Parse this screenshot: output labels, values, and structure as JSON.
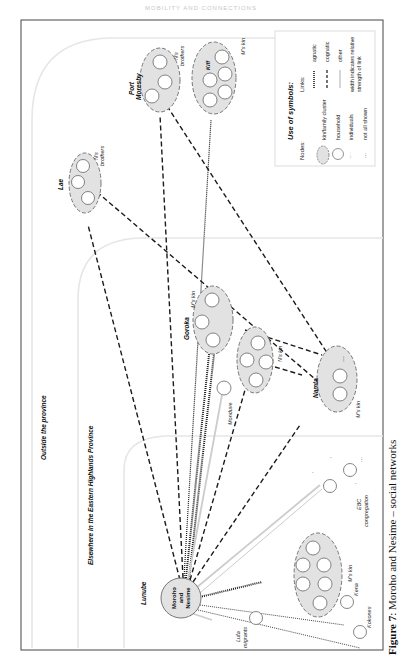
{
  "figure": {
    "caption_label": "Figure 7",
    "caption_text": ": Moroho and Nesime – social networks",
    "running_header": "MOBILITY AND CONNECTIONS"
  },
  "zones": [
    {
      "id": "outside",
      "label": "Outside the province"
    },
    {
      "id": "ehp",
      "label": "Elsewhere in the Eastern Highlands Province"
    },
    {
      "id": "lunube",
      "label": "Lunube"
    }
  ],
  "nodes": {
    "center": {
      "line1": "Moroho",
      "line2": "and",
      "line3": "Nesime"
    },
    "port_moresby": {
      "place": "Port Moresby",
      "place_line1": "Port",
      "place_line2": "Moresby",
      "label_line1": "N's",
      "label_line2": "brothers"
    },
    "kiff": {
      "place": "Kiff",
      "label": "M's kin"
    },
    "lae": {
      "place": "Lae",
      "label_line1": "N's",
      "label_line2": "brothers"
    },
    "goroka": {
      "place": "Goroka",
      "label": "M's kin"
    },
    "goroka_nkin": {
      "label": "N's kin"
    },
    "monduve": {
      "label": "Monduve"
    },
    "namta": {
      "place": "Namta",
      "label": "M's kin"
    },
    "lunube_mkin": {
      "label": "M's kin"
    },
    "ebc": {
      "label_line1": "EBC",
      "label_line2": "congregation"
    },
    "kena": {
      "label": "Kena"
    },
    "kokones": {
      "label": "Kokones"
    },
    "lufa": {
      "label_line1": "Lufa",
      "label_line2": "migrants"
    }
  },
  "legend": {
    "title": "Use of symbols:",
    "nodes_heading": "Nodes:",
    "links_heading": "Links:",
    "node_items": [
      "kin/family cluster",
      "household",
      "individuals",
      "not all shown"
    ],
    "link_items": [
      "agnatic",
      "cognatic",
      "other"
    ],
    "width_note_line1": "width indicates relative",
    "width_note_line2": "strength of link"
  },
  "colors": {
    "cluster_fill": "#e2e2e2",
    "cluster_stroke": "#777777",
    "zone_stroke": "#e6e6e6",
    "link_dark": "#1a1a1a",
    "link_other": "#cccccc",
    "frame": "#444444"
  }
}
